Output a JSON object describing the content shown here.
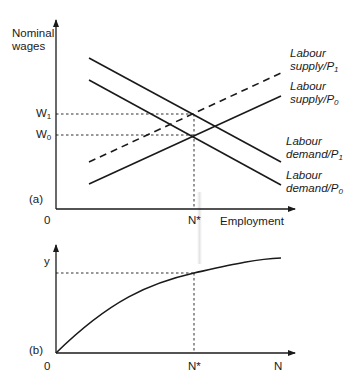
{
  "panel_a": {
    "panel_label": "(a)",
    "y_axis_label_line1": "Nominal",
    "y_axis_label_line2": "wages",
    "x_axis_label": "Employment",
    "origin_label": "0",
    "w1_label": "W",
    "w1_sub": "1",
    "w0_label": "W",
    "w0_sub": "0",
    "nstar_label": "N*",
    "curves": {
      "supply_p1": {
        "line1": "Labour",
        "line2": "supply/P",
        "sub": "1",
        "style": "dashed"
      },
      "supply_p0": {
        "line1": "Labour",
        "line2": "supply/P",
        "sub": "0",
        "style": "solid"
      },
      "demand_p1": {
        "line1": "Labour",
        "line2": "demand/P",
        "sub": "1",
        "style": "solid"
      },
      "demand_p0": {
        "line1": "Labour",
        "line2": "demand/P",
        "sub": "0",
        "style": "solid"
      }
    }
  },
  "panel_b": {
    "panel_label": "(b)",
    "y_axis_label": "y",
    "x_axis_label": "N",
    "origin_label": "0",
    "nstar_label": "N*"
  },
  "colors": {
    "ink": "#1a1a1a",
    "background": "#ffffff"
  }
}
